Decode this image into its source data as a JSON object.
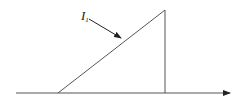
{
  "diagram": {
    "label": {
      "main": "I",
      "subscript": "1"
    },
    "colors": {
      "line": "#555555",
      "arrow": "#222222",
      "background": "#ffffff"
    },
    "geometry": {
      "baseline": {
        "x1": 16,
        "x2": 232,
        "y": 93
      },
      "ramp": {
        "x1": 58,
        "y1": 93,
        "x2": 165,
        "y2": 10
      },
      "drop": {
        "x": 165,
        "y1": 10,
        "y2": 93
      },
      "pointer": {
        "x1": 89,
        "y1": 19,
        "x2": 122,
        "y2": 39
      }
    }
  }
}
